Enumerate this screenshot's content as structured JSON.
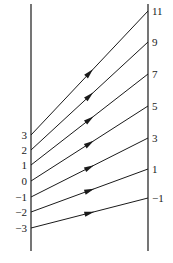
{
  "diagram": {
    "left_axis": {
      "x": 31,
      "y_top": 4,
      "y_bottom": 251
    },
    "right_axis": {
      "x": 148,
      "y_top": 4,
      "y_bottom": 251
    },
    "line_color": "#1a1a1a",
    "mappings": [
      {
        "from_label": "3",
        "from_y": 135,
        "to_label": "11",
        "to_y": 11
      },
      {
        "from_label": "2",
        "from_y": 150,
        "to_label": "9",
        "to_y": 42
      },
      {
        "from_label": "1",
        "from_y": 165,
        "to_label": "7",
        "to_y": 74
      },
      {
        "from_label": "0",
        "from_y": 181,
        "to_label": "5",
        "to_y": 106
      },
      {
        "from_label": "−1",
        "from_y": 197,
        "to_label": "3",
        "to_y": 138
      },
      {
        "from_label": "−2",
        "from_y": 212,
        "to_label": "1",
        "to_y": 169
      },
      {
        "from_label": "−3",
        "from_y": 228,
        "to_label": "−1",
        "to_y": 198
      }
    ]
  }
}
